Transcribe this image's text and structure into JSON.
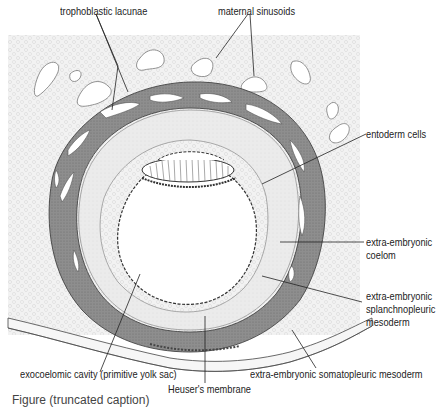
{
  "figure": {
    "type": "anatomical cross-section diagram",
    "colors": {
      "background_tissue": "#f0f0f0",
      "trophoblast": "#8a8a8a",
      "trophoblast_outline": "#555555",
      "mesoderm": "#e4e4e4",
      "cavity": "#ffffff",
      "leader_lines": "#222222"
    }
  },
  "labels": {
    "trophoblastic_lacunae": "trophoblastic lacunae",
    "maternal_sinusoids": "maternal sinusoids",
    "entoderm_cells": "entoderm cells",
    "extra_embryonic_coelom_1": "extra-embryonic",
    "extra_embryonic_coelom_2": "coelom",
    "splanchnopleuric_1": "extra-embryonic",
    "splanchnopleuric_2": "splanchnopleuric",
    "splanchnopleuric_3": "mesoderm",
    "exocoelomic_cavity": "exocoelomic cavity (primitive yolk sac)",
    "heusers_membrane": "Heuser's membrane",
    "somatopleuric_mesoderm": "extra-embryonic somatopleuric mesoderm"
  },
  "caption": {
    "text": "Figure (truncated caption)"
  }
}
